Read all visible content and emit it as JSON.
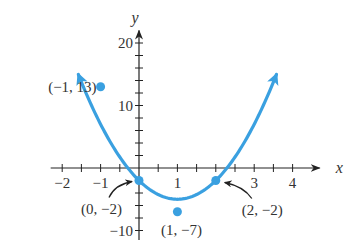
{
  "chart_data": {
    "type": "line",
    "title": "",
    "function": "y = 3x^2 - 6x - 2",
    "xlabel": "x",
    "ylabel": "y",
    "xlim": [
      -2.3,
      4.6
    ],
    "ylim": [
      -11.5,
      22
    ],
    "x_tick_labels": [
      {
        "value": -2,
        "label": "−2"
      },
      {
        "value": -1,
        "label": "−1"
      },
      {
        "value": 1,
        "label": "1"
      },
      {
        "value": 3,
        "label": "3"
      },
      {
        "value": 4,
        "label": "4"
      }
    ],
    "x_minor_ticks": [
      -2,
      -1.5,
      -1,
      -0.5,
      0.5,
      1,
      1.5,
      2,
      2.5,
      3,
      3.5,
      4
    ],
    "y_tick_labels": [
      {
        "value": 20,
        "label": "20"
      },
      {
        "value": 10,
        "label": "10"
      },
      {
        "value": -10,
        "label": "−10"
      }
    ],
    "y_minor_ticks": [
      -10,
      -8,
      -6,
      -4,
      -2,
      2,
      4,
      6,
      8,
      10,
      12,
      14,
      16,
      18,
      20
    ],
    "series": [
      {
        "name": "parabola",
        "color": "#3aa0e0",
        "x_range": [
          -1.58,
          3.58
        ]
      }
    ],
    "points": [
      {
        "x": -1,
        "y": 13,
        "label": "(−1, 13)"
      },
      {
        "x": 0,
        "y": -2,
        "label": "(0, −2)"
      },
      {
        "x": 1,
        "y": -7,
        "label": "(1, −7)"
      },
      {
        "x": 2,
        "y": -2,
        "label": "(2, −2)"
      }
    ],
    "grid": false
  }
}
